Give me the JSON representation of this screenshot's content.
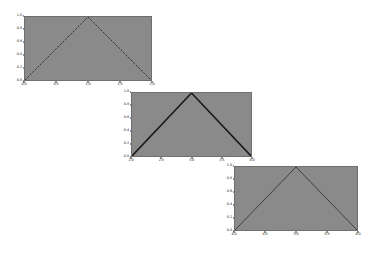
{
  "figure": {
    "width": 372,
    "height": 253,
    "background_color": "#ffffff",
    "axes_face_color": "#8a8a8a",
    "line_color": "#1a1a1a"
  },
  "chart_data": [
    {
      "type": "line",
      "name": "triangle-wave-segment-1",
      "title": "",
      "xlabel": "",
      "ylabel": "",
      "xlim": [
        0.0,
        2.0
      ],
      "ylim": [
        0.0,
        1.0
      ],
      "xticks": [
        "0.0",
        "0.5",
        "1.0",
        "1.5",
        "2.0"
      ],
      "yticks": [
        "0.0",
        "0.2",
        "0.4",
        "0.6",
        "0.8",
        "1.0"
      ],
      "xtick_values": [
        0.0,
        0.5,
        1.0,
        1.5,
        2.0
      ],
      "ytick_values": [
        0.0,
        0.2,
        0.4,
        0.6,
        0.8,
        1.0
      ],
      "grid": false,
      "legend": null,
      "linestyle": "dotted",
      "linewidth": 1.0,
      "x": [
        0.0,
        1.0,
        2.0
      ],
      "y": [
        0.0,
        1.0,
        0.0
      ]
    },
    {
      "type": "line",
      "name": "triangle-wave-segment-2",
      "title": "",
      "xlabel": "",
      "ylabel": "",
      "xlim": [
        2.0,
        4.0
      ],
      "ylim": [
        0.0,
        1.0
      ],
      "xticks": [
        "2.0",
        "2.5",
        "3.0",
        "3.5",
        "4.0"
      ],
      "yticks": [
        "0.0",
        "0.2",
        "0.4",
        "0.6",
        "0.8",
        "1.0"
      ],
      "xtick_values": [
        2.0,
        2.5,
        3.0,
        3.5,
        4.0
      ],
      "ytick_values": [
        0.0,
        0.2,
        0.4,
        0.6,
        0.8,
        1.0
      ],
      "grid": false,
      "legend": null,
      "linestyle": "solid",
      "linewidth": 1.6,
      "x": [
        2.0,
        3.0,
        4.0
      ],
      "y": [
        0.0,
        1.0,
        0.0
      ]
    },
    {
      "type": "line",
      "name": "triangle-wave-segment-3",
      "title": "",
      "xlabel": "",
      "ylabel": "",
      "xlim": [
        4.0,
        6.0
      ],
      "ylim": [
        0.0,
        1.0
      ],
      "xticks": [
        "4.0",
        "4.5",
        "5.0",
        "5.5",
        "6.0"
      ],
      "yticks": [
        "0.0",
        "0.2",
        "0.4",
        "0.6",
        "0.8",
        "1.0"
      ],
      "xtick_values": [
        4.0,
        4.5,
        5.0,
        5.5,
        6.0
      ],
      "ytick_values": [
        0.0,
        0.2,
        0.4,
        0.6,
        0.8,
        1.0
      ],
      "grid": false,
      "legend": null,
      "linestyle": "solid",
      "linewidth": 0.7,
      "x": [
        4.0,
        5.0,
        6.0
      ],
      "y": [
        0.0,
        1.0,
        0.0
      ]
    }
  ],
  "axes_layout": [
    {
      "left": 24,
      "top": 16,
      "width": 128,
      "height": 65
    },
    {
      "left": 131,
      "top": 92,
      "width": 121,
      "height": 65
    },
    {
      "left": 234,
      "top": 166,
      "width": 124,
      "height": 65
    }
  ]
}
